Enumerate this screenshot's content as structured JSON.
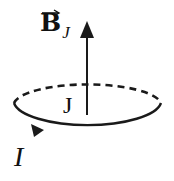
{
  "diagram": {
    "labels": {
      "field_vector": "B",
      "field_subscript": "J",
      "loop_label": "J",
      "current_label": "I"
    },
    "colors": {
      "stroke": "#1a1a1a",
      "background": "#ffffff"
    },
    "elements": [
      {
        "type": "arrow",
        "meaning": "magnetic field B_J pointing up along loop axis"
      },
      {
        "type": "ellipse",
        "meaning": "current loop J, back half dashed, front half solid"
      },
      {
        "type": "arrowhead",
        "meaning": "direction of current I along loop"
      }
    ]
  }
}
